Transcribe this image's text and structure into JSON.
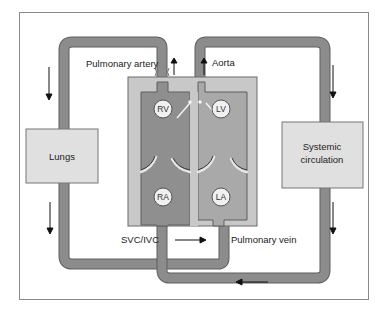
{
  "labels": {
    "pulmonary_artery": "Pulmonary artery",
    "aorta": "Aorta",
    "lungs": "Lungs",
    "systemic": "Systemic",
    "circulation": "circulation",
    "svc_ivc": "SVC/IVC",
    "pulmonary_vein": "Pulmonary vein"
  },
  "chambers": {
    "rv": "RV",
    "lv": "LV",
    "ra": "RA",
    "la": "LA"
  },
  "colors": {
    "frame": "#8a8a8a",
    "pipe": "#8c8c8c",
    "pipe_edge": "#5e5e5e",
    "heart_outer": "#c8c8c8",
    "right_heart": "#8f8f8f",
    "left_heart": "#a9a9a9",
    "box_fill": "#e0e0e0",
    "chamber_circle": "#f0f0f0"
  }
}
